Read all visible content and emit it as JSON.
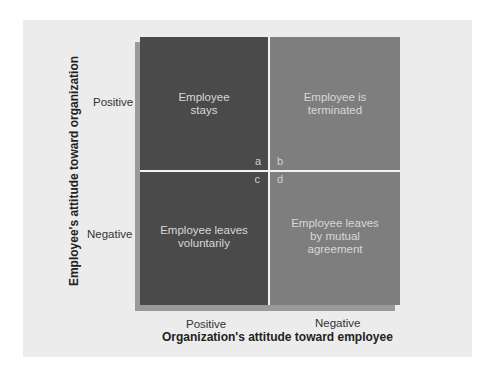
{
  "diagram": {
    "type": "2x2 matrix",
    "y_axis": {
      "title": "Employee's attitude toward organization",
      "labels": [
        "Positive",
        "Negative"
      ]
    },
    "x_axis": {
      "title": "Organization's attitude toward employee",
      "labels": [
        "Positive",
        "Negative"
      ]
    },
    "quadrants": [
      {
        "id": "a",
        "line1": "Employee",
        "line2": "stays",
        "line3": ""
      },
      {
        "id": "b",
        "line1": "Employee is",
        "line2": "terminated",
        "line3": ""
      },
      {
        "id": "c",
        "line1": "Employee leaves",
        "line2": "voluntarily",
        "line3": ""
      },
      {
        "id": "d",
        "line1": "Employee leaves",
        "line2": "by mutual",
        "line3": "agreement"
      }
    ],
    "colors": {
      "dark_quadrant": "#4a4a4a",
      "light_quadrant": "#7e7e7e",
      "panel": "#ececec"
    }
  }
}
